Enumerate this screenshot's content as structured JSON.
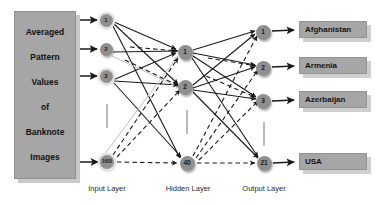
{
  "figure": {
    "type": "neural-network-architecture-diagram"
  },
  "input_block": {
    "lines": [
      "Averaged",
      "Pattern",
      "Values",
      "of",
      "Banknote",
      "Images"
    ],
    "fill_color": "#a6a6a6"
  },
  "layers": {
    "input": {
      "caption": "Input Layer",
      "nodes": [
        {
          "label": "1",
          "cx": 106,
          "cy": 20
        },
        {
          "label": "2",
          "cx": 106,
          "cy": 49
        },
        {
          "label": "3",
          "cx": 106,
          "cy": 76
        },
        {
          "label": "1600",
          "cx": 107,
          "cy": 162
        }
      ]
    },
    "hidden": {
      "caption": "Hidden Layer",
      "nodes": [
        {
          "label": "1",
          "cx": 185,
          "cy": 52
        },
        {
          "label": "2",
          "cx": 185,
          "cy": 87
        },
        {
          "label": "40",
          "cx": 187,
          "cy": 163
        }
      ]
    },
    "output": {
      "caption": "Output Layer",
      "nodes": [
        {
          "label": "1",
          "cx": 263,
          "cy": 32
        },
        {
          "label": "2",
          "cx": 263,
          "cy": 68
        },
        {
          "label": "3",
          "cx": 263,
          "cy": 101
        },
        {
          "label": "21",
          "cx": 264,
          "cy": 163
        }
      ]
    }
  },
  "classes": [
    {
      "label": "Afghanistan",
      "x": 299,
      "y": 21,
      "w": 68,
      "h": 17
    },
    {
      "label": "Armenia",
      "x": 299,
      "y": 57,
      "w": 68,
      "h": 17
    },
    {
      "label": "Azerbaijan",
      "x": 299,
      "y": 91,
      "w": 68,
      "h": 17
    },
    {
      "label": "USA",
      "x": 299,
      "y": 153,
      "w": 68,
      "h": 17
    }
  ],
  "colors": {
    "node_fill": "#8f8f8f",
    "node_halo": "#e2e2e2",
    "box_fill": "#a6a6a6",
    "shadow": "#cfcfcf",
    "edge_solid": "#1a1a1a",
    "edge_dashed": "#1a1a1a",
    "edge_light": "#c0c0c0",
    "background": "#ffffff"
  },
  "edges": {
    "solid_count": 20,
    "dashed_count": 13,
    "style_note": "solid black arrows for near connections, dashed black arrows for distant/elided connections"
  }
}
